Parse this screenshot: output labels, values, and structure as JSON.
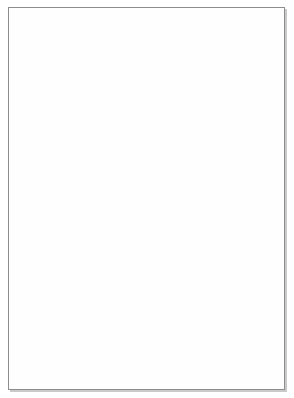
{
  "figure": {
    "background_color": "#ffffff",
    "border_color": "#8d8d8d"
  },
  "anterior_column": {
    "name": "anterior-gene-column",
    "bands": [
      {
        "label": "Otx2",
        "shade": "light"
      },
      {
        "label": "Msx",
        "shade": "dark"
      },
      {
        "label": "Dlx",
        "shade": "light"
      },
      {
        "label": "Barx",
        "shade": "dark"
      }
    ]
  },
  "hox_columns": [
    {
      "name": "hox-column-1",
      "labels": [
        {
          "line1": "Hox-",
          "line2": "B1"
        },
        {
          "line1": "Hox-",
          "line2": "A2 B2"
        }
      ]
    },
    {
      "name": "hox-column-2",
      "labels": [
        {
          "line1": "Hox-",
          "line2": "A3 B3"
        },
        {
          "line1": "Hox-",
          "line2": "A2 B2"
        }
      ]
    },
    {
      "name": "hox-column-3",
      "labels": [
        {
          "line1": "Hox-",
          "line2": "A4 B4"
        },
        {
          "line1": "Hox-",
          "line2": "A3 B3"
        },
        {
          "line1": "Hox-",
          "line2": "A2 B2"
        }
      ]
    }
  ],
  "artwork": {
    "embryo_head": "embryo-head-shape",
    "arches": [
      "arch-1",
      "arch-2",
      "arch-3",
      "arch-4",
      "arch-5"
    ],
    "arrows": [
      "migration-arrow-1",
      "migration-arrow-2",
      "migration-arrow-3",
      "migration-arrow-4",
      "migration-arrow-5"
    ],
    "colors": {
      "head_light": "#d9d9d9",
      "head_mid": "#b6b6b6",
      "head_dark": "#9a9a9a",
      "arrow_fill": "#b0b0b0",
      "arrow_edge": "#7c7c7c"
    }
  }
}
